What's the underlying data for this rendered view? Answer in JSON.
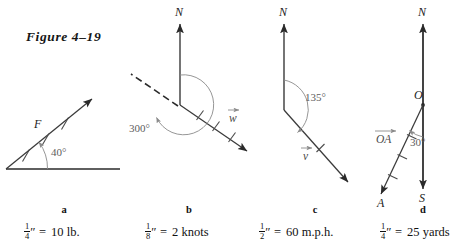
{
  "figure": {
    "title": "Figure 4–19"
  },
  "panels": [
    {
      "letter": "a",
      "caption_num": "1",
      "caption_den": "4",
      "caption_unit": "″",
      "caption_eq": "=",
      "caption_value": "10 lb.",
      "labels": {
        "vector": "F",
        "angle": "40°"
      }
    },
    {
      "letter": "b",
      "caption_num": "1",
      "caption_den": "8",
      "caption_unit": "″",
      "caption_eq": "=",
      "caption_value": "2 knots",
      "labels": {
        "north": "N",
        "vector": "w",
        "angle": "300°"
      }
    },
    {
      "letter": "c",
      "caption_num": "1",
      "caption_den": "2",
      "caption_unit": "″",
      "caption_eq": "=",
      "caption_value": "60 m.p.h.",
      "labels": {
        "north": "N",
        "vector": "v",
        "angle": "135°"
      }
    },
    {
      "letter": "d",
      "caption_num": "1",
      "caption_den": "4",
      "caption_unit": "″",
      "caption_eq": "=",
      "caption_value": "25 yards",
      "labels": {
        "north": "N",
        "south": "S",
        "origin": "O",
        "endpoint": "A",
        "vector": "OA",
        "angle": "30°"
      }
    }
  ],
  "colors": {
    "ink": "#2a2a2a",
    "arc": "#8a8a8a",
    "label": "#4a4a4a",
    "page": "#ffffff"
  }
}
